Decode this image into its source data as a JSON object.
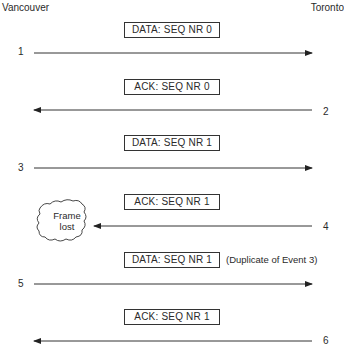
{
  "diagram": {
    "endpoints": {
      "left": "Vancouver",
      "right": "Toronto"
    },
    "events": [
      {
        "number": "1",
        "direction": "right",
        "frame": "DATA:  SEQ NR 0",
        "annotation": ""
      },
      {
        "number": "2",
        "direction": "left",
        "frame": "ACK:  SEQ NR 0",
        "annotation": ""
      },
      {
        "number": "3",
        "direction": "right",
        "frame": "DATA:  SEQ NR 1",
        "annotation": ""
      },
      {
        "number": "4",
        "direction": "left",
        "frame": "ACK:  SEQ NR 1",
        "annotation": "",
        "lost": true
      },
      {
        "number": "5",
        "direction": "right",
        "frame": "DATA:  SEQ NR 1",
        "annotation": "(Duplicate of Event 3)"
      },
      {
        "number": "6",
        "direction": "left",
        "frame": "ACK:  SEQ NR 1",
        "annotation": ""
      }
    ],
    "lost_frame_label": {
      "line1": "Frame",
      "line2": "lost"
    }
  }
}
